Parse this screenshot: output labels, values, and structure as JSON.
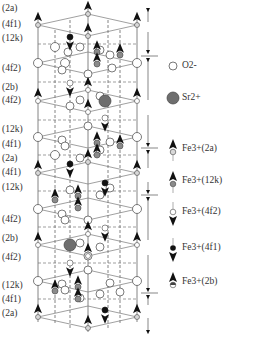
{
  "layer_labels": [
    {
      "text": "(2a)",
      "y": 8
    },
    {
      "text": "(4f1)",
      "y": 24
    },
    {
      "text": "(12k)",
      "y": 38
    },
    {
      "text": "(4f2)",
      "y": 68
    },
    {
      "text": "(2b)",
      "y": 87
    },
    {
      "text": "(4f2)",
      "y": 100
    },
    {
      "text": "(12k)",
      "y": 129
    },
    {
      "text": "(4f1)",
      "y": 144
    },
    {
      "text": "(2a)",
      "y": 158
    },
    {
      "text": "(4f1)",
      "y": 172
    },
    {
      "text": "(12k)",
      "y": 187
    },
    {
      "text": "(4f2)",
      "y": 219
    },
    {
      "text": "(2b)",
      "y": 238
    },
    {
      "text": "(4f2)",
      "y": 257
    },
    {
      "text": "(12k)",
      "y": 285
    },
    {
      "text": "(4f1)",
      "y": 299
    },
    {
      "text": "(2a)",
      "y": 313
    }
  ],
  "legend": {
    "items": [
      {
        "label": "O2-",
        "symbol": "open-circle",
        "y": 62
      },
      {
        "label": "Sr2+",
        "symbol": "dark-circle",
        "y": 94
      },
      {
        "label": "Fe3+(2a)",
        "symbol": "up-arrow-light-circle",
        "y": 145
      },
      {
        "label": "Fe3+(12k)",
        "symbol": "up-arrow-gray-circle",
        "y": 177
      },
      {
        "label": "Fe3+(4f2)",
        "symbol": "down-arrow-open-circle",
        "y": 208
      },
      {
        "label": "Fe3+(4f1)",
        "symbol": "down-arrow-black-circle",
        "y": 244
      },
      {
        "label": "Fe3+(2b)",
        "symbol": "up-arrow-half-circle",
        "y": 278
      }
    ]
  },
  "colors": {
    "oxygen_fill": "#ffffff",
    "strontium_fill": "#6e6e6e",
    "fe_2a_fill": "#d8d8d8",
    "fe_12k_fill": "#8a8a8a",
    "fe_4f1_fill": "#111111",
    "line": "#555555",
    "arrow": "#111111"
  }
}
